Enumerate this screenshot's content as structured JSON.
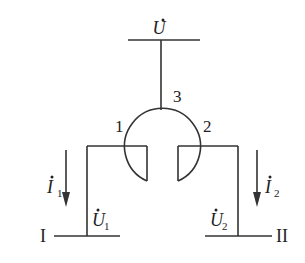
{
  "diagram": {
    "type": "three-winding junction / circuit schematic",
    "supply": {
      "label": "U",
      "dot": true
    },
    "junction": {
      "node_labels": [
        "1",
        "2",
        "3"
      ]
    },
    "branch_left": {
      "bus_label": "I",
      "voltage": {
        "label": "U",
        "subscript": "1",
        "dot": true
      },
      "current": {
        "label": "I",
        "subscript": "1",
        "dot": true,
        "direction": "down"
      }
    },
    "branch_right": {
      "bus_label": "II",
      "voltage": {
        "label": "U",
        "subscript": "2",
        "dot": true
      },
      "current": {
        "label": "I",
        "subscript": "2",
        "dot": true,
        "direction": "down"
      }
    },
    "colors": {
      "line": "#333333",
      "background": "#ffffff"
    }
  }
}
